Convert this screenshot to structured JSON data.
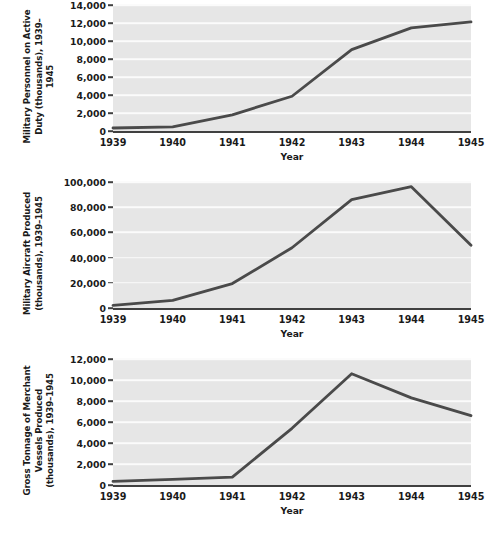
{
  "figure": {
    "width": 499,
    "height": 542,
    "background": "#ffffff",
    "plot_background": "#e6e6e6",
    "gridline_color": "#fbfbfb",
    "line_color": "#4a4a4a",
    "axis_color": "#404040",
    "text_color": "#1a1a1a"
  },
  "chart_data": [
    {
      "type": "line",
      "title": "",
      "ylabel": "Military Personnel on Active Duty (thousands), 1939–1945",
      "xlabel": "Year",
      "categories": [
        "1939",
        "1940",
        "1941",
        "1942",
        "1943",
        "1944",
        "1945"
      ],
      "x": [
        1939,
        1940,
        1941,
        1942,
        1943,
        1944,
        1945
      ],
      "values": [
        334,
        458,
        1800,
        3859,
        9045,
        11452,
        12124
      ],
      "series": [
        {
          "name": "Military Personnel on Active Duty",
          "values": [
            334,
            458,
            1800,
            3859,
            9045,
            11452,
            12124
          ]
        }
      ],
      "ylim": [
        0,
        14000
      ],
      "ytick_values": [
        0,
        2000,
        4000,
        6000,
        8000,
        10000,
        12000,
        14000
      ],
      "ytick_labels": [
        "0",
        "2,000",
        "4,000",
        "6,000",
        "8,000",
        "10,000",
        "12,000",
        "14,000"
      ],
      "grid": true,
      "legend": "none"
    },
    {
      "type": "line",
      "title": "",
      "ylabel": "Military Aircraft Produced (thousands), 1939–1945",
      "xlabel": "Year",
      "categories": [
        "1939",
        "1940",
        "1941",
        "1942",
        "1943",
        "1944",
        "1945"
      ],
      "x": [
        1939,
        1940,
        1941,
        1942,
        1943,
        1944,
        1945
      ],
      "values": [
        2100,
        6100,
        19400,
        47800,
        86000,
        96300,
        49800
      ],
      "series": [
        {
          "name": "Military Aircraft Produced",
          "values": [
            2100,
            6100,
            19400,
            47800,
            86000,
            96300,
            49800
          ]
        }
      ],
      "ylim": [
        0,
        100000
      ],
      "ytick_values": [
        0,
        20000,
        40000,
        60000,
        80000,
        100000
      ],
      "ytick_labels": [
        "0",
        "20,000",
        "40,000",
        "60,000",
        "80,000",
        "100,000"
      ],
      "grid": true,
      "legend": "none"
    },
    {
      "type": "line",
      "title": "",
      "ylabel": "Gross Tonnage of Merchant Vessels Produced (thousands), 1939–1945",
      "xlabel": "Year",
      "categories": [
        "1939",
        "1940",
        "1941",
        "1942",
        "1943",
        "1944",
        "1945"
      ],
      "x": [
        1939,
        1940,
        1941,
        1942,
        1943,
        1944,
        1945
      ],
      "values": [
        340,
        530,
        750,
        5400,
        10600,
        8300,
        6600
      ],
      "series": [
        {
          "name": "Gross Tonnage of Merchant Vessels Produced",
          "values": [
            340,
            530,
            750,
            5400,
            10600,
            8300,
            6600
          ]
        }
      ],
      "ylim": [
        0,
        12000
      ],
      "ytick_values": [
        0,
        2000,
        4000,
        6000,
        8000,
        10000,
        12000
      ],
      "ytick_labels": [
        "0",
        "2,000",
        "4,000",
        "6,000",
        "8,000",
        "10,000",
        "12,000"
      ],
      "grid": true,
      "legend": "none"
    }
  ]
}
